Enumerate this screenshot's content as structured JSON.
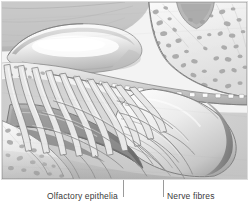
{
  "figure": {
    "kind": "anatomical-illustration",
    "style": "grayscale pencil / airbrush medical illustration",
    "frame": {
      "border_color": "#dcdcdc",
      "background": "#ffffff"
    }
  },
  "illustration": {
    "palette": {
      "paper": "#f4f4f4",
      "light_tissue": "#efefef",
      "mid_tissue": "#cfcfcf",
      "shadow": "#9c9c9c",
      "deep_shadow": "#6f6f6f",
      "outline": "#7a7a7a",
      "bone_fill": "#ededed",
      "bone_cell": "#a9a9a9",
      "highlight": "#fbfbfb"
    },
    "structures": [
      {
        "name": "olfactory-bulb",
        "note": "elongated light lobe, upper left"
      },
      {
        "name": "cribriform-plate",
        "note": "perforated bone band with foramina"
      },
      {
        "name": "olfactory-nerve-bundles",
        "note": "vertical fascicles through foramina"
      },
      {
        "name": "nasal-mucosa-fan",
        "note": "large curved membrane, right"
      },
      {
        "name": "superior-turbinate",
        "note": "scrolled bone, lower left"
      },
      {
        "name": "cancellous-bone-upper-right",
        "note": "trabecular spongy bone"
      },
      {
        "name": "cancellous-bone-lower-left",
        "note": "trabecular spongy bone"
      },
      {
        "name": "branching-nerve-fibres",
        "note": "fine fibres spreading over mucosa"
      }
    ]
  },
  "labels": {
    "olfactory_epithelia": "Olfactory epithelia",
    "nerve_fibres": "Nerve fibres",
    "leader_color": "#9a9a9a"
  }
}
